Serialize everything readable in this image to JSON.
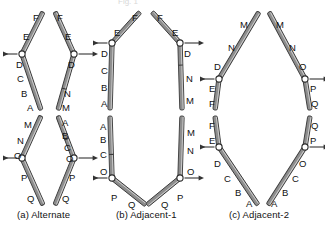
{
  "figure": {
    "top_fragment": "Fig. 1",
    "background": "#ffffff",
    "rod_fill": "#8d8d8d",
    "rod_stroke": "#3a3a3a",
    "joint_fill": "#ffffff",
    "joint_stroke": "#2b2b2b",
    "arrow_color": "#333333",
    "text_color": "#111111"
  },
  "captions": [
    {
      "id": "a",
      "text": "(a) Alternate",
      "x": 17,
      "y": 209
    },
    {
      "id": "b",
      "text": "(b) Adjacent-1",
      "x": 116,
      "y": 209
    },
    {
      "id": "c",
      "text": "(c) Adjacent-2",
      "x": 229,
      "y": 209
    }
  ],
  "panels": [
    {
      "id": "a",
      "name": "Alternate",
      "rods": [
        {
          "name": "a-top-left-upper",
          "x1": 43,
          "y1": 12,
          "x2": 22,
          "y1b": 0,
          "x2b": 0,
          "y2": 54,
          "tick": null
        },
        {
          "name": "a-top-left-lower",
          "x1": 22,
          "y1": 54,
          "x2": 41,
          "y2": 110,
          "tick": null
        },
        {
          "name": "a-top-right-upper",
          "x1": 55,
          "y1": 12,
          "x2": 74,
          "y2": 54,
          "tick": null
        },
        {
          "name": "a-top-right-lower",
          "x1": 74,
          "y1": 54,
          "x2": 58,
          "y2": 110,
          "tick": 0.62
        },
        {
          "name": "a-bot-left-upper",
          "x1": 41,
          "y1": 116,
          "x2": 22,
          "y2": 158,
          "tick": null
        },
        {
          "name": "a-bot-left-lower",
          "x1": 22,
          "y1": 158,
          "x2": 43,
          "y2": 205,
          "tick": null
        },
        {
          "name": "a-bot-right-upper",
          "x1": 58,
          "y1": 116,
          "x2": 74,
          "y2": 158,
          "tick": 0.55
        },
        {
          "name": "a-bot-right-lower",
          "x1": 74,
          "y1": 158,
          "x2": 55,
          "y2": 205,
          "tick": null
        }
      ],
      "joints": [
        {
          "name": "a-joint-upper-left",
          "x": 22,
          "y": 54,
          "arrow": "left"
        },
        {
          "name": "a-joint-upper-right",
          "x": 74,
          "y": 54,
          "arrow": "right"
        },
        {
          "name": "a-joint-lower-left",
          "x": 22,
          "y": 158,
          "arrow": "left"
        },
        {
          "name": "a-joint-lower-right",
          "x": 74,
          "y": 158,
          "arrow": "right"
        }
      ],
      "labels": [
        {
          "t": "F",
          "x": 33,
          "y": 13
        },
        {
          "t": "E",
          "x": 23,
          "y": 32
        },
        {
          "t": "D",
          "x": 16,
          "y": 60
        },
        {
          "t": "C",
          "x": 17,
          "y": 74
        },
        {
          "t": "B",
          "x": 21,
          "y": 89
        },
        {
          "t": "A",
          "x": 27,
          "y": 103
        },
        {
          "t": "F",
          "x": 57,
          "y": 13
        },
        {
          "t": "E",
          "x": 65,
          "y": 32
        },
        {
          "t": "D",
          "x": 68,
          "y": 60
        },
        {
          "t": "N",
          "x": 64,
          "y": 89
        },
        {
          "t": "M",
          "x": 62,
          "y": 103
        },
        {
          "t": "M",
          "x": 24,
          "y": 120
        },
        {
          "t": "N",
          "x": 17,
          "y": 136
        },
        {
          "t": "O",
          "x": 14,
          "y": 151
        },
        {
          "t": "P",
          "x": 21,
          "y": 173
        },
        {
          "t": "Q",
          "x": 27,
          "y": 194
        },
        {
          "t": "A",
          "x": 62,
          "y": 118
        },
        {
          "t": "B",
          "x": 62,
          "y": 131
        },
        {
          "t": "C",
          "x": 64,
          "y": 143
        },
        {
          "t": "O",
          "x": 66,
          "y": 154
        },
        {
          "t": "P",
          "x": 69,
          "y": 173
        },
        {
          "t": "Q",
          "x": 62,
          "y": 194
        }
      ]
    },
    {
      "id": "b",
      "name": "Adjacent-1",
      "rods": [
        {
          "name": "b-top-left-upper",
          "x1": 140,
          "y1": 12,
          "x2": 112,
          "y2": 43,
          "tick": null
        },
        {
          "name": "b-top-left-lower",
          "x1": 112,
          "y1": 43,
          "x2": 110,
          "y2": 110,
          "tick": null
        },
        {
          "name": "b-top-right-upper",
          "x1": 152,
          "y1": 12,
          "x2": 180,
          "y2": 43,
          "tick": null
        },
        {
          "name": "b-top-right-lower",
          "x1": 180,
          "y1": 43,
          "x2": 182,
          "y2": 110,
          "tick": 0.33
        },
        {
          "name": "b-bot-left-upper",
          "x1": 110,
          "y1": 116,
          "x2": 112,
          "y2": 178,
          "tick": 0.62
        },
        {
          "name": "b-bot-left-lower",
          "x1": 112,
          "y1": 178,
          "x2": 146,
          "y2": 205,
          "tick": null
        },
        {
          "name": "b-bot-right-upper",
          "x1": 182,
          "y1": 116,
          "x2": 180,
          "y2": 178,
          "tick": null
        },
        {
          "name": "b-bot-right-lower",
          "x1": 180,
          "y1": 178,
          "x2": 147,
          "y2": 205,
          "tick": null
        }
      ],
      "joints": [
        {
          "name": "b-joint-upper-left",
          "x": 112,
          "y": 43,
          "arrow": "left"
        },
        {
          "name": "b-joint-upper-right",
          "x": 180,
          "y": 43,
          "arrow": "right"
        },
        {
          "name": "b-joint-lower-left",
          "x": 112,
          "y": 178,
          "arrow": "left"
        },
        {
          "name": "b-joint-lower-right",
          "x": 180,
          "y": 178,
          "arrow": "right"
        }
      ],
      "labels": [
        {
          "t": "F",
          "x": 132,
          "y": 13
        },
        {
          "t": "E",
          "x": 114,
          "y": 28
        },
        {
          "t": "D",
          "x": 101,
          "y": 49
        },
        {
          "t": "C",
          "x": 101,
          "y": 66
        },
        {
          "t": "B",
          "x": 101,
          "y": 83
        },
        {
          "t": "A",
          "x": 101,
          "y": 99
        },
        {
          "t": "F",
          "x": 157,
          "y": 13
        },
        {
          "t": "E",
          "x": 172,
          "y": 28
        },
        {
          "t": "D",
          "x": 184,
          "y": 49
        },
        {
          "t": "N",
          "x": 186,
          "y": 74
        },
        {
          "t": "M",
          "x": 186,
          "y": 96
        },
        {
          "t": "A",
          "x": 100,
          "y": 122
        },
        {
          "t": "B",
          "x": 100,
          "y": 135
        },
        {
          "t": "C",
          "x": 100,
          "y": 150
        },
        {
          "t": "O",
          "x": 100,
          "y": 167
        },
        {
          "t": "P",
          "x": 111,
          "y": 193
        },
        {
          "t": "Q",
          "x": 128,
          "y": 200
        },
        {
          "t": "M",
          "x": 187,
          "y": 128
        },
        {
          "t": "N",
          "x": 187,
          "y": 146
        },
        {
          "t": "O",
          "x": 187,
          "y": 167
        },
        {
          "t": "P",
          "x": 177,
          "y": 193
        },
        {
          "t": "Q",
          "x": 161,
          "y": 200
        }
      ]
    },
    {
      "id": "c",
      "name": "Adjacent-2",
      "rods": [
        {
          "name": "c-top-left-upper",
          "x1": 259,
          "y1": 12,
          "x2": 219,
          "y2": 79,
          "tick": null
        },
        {
          "name": "c-top-left-lower",
          "x1": 219,
          "y1": 79,
          "x2": 215,
          "y2": 110,
          "tick": null
        },
        {
          "name": "c-top-right-upper",
          "x1": 269,
          "y1": 12,
          "x2": 305,
          "y2": 79,
          "tick": null
        },
        {
          "name": "c-top-right-lower",
          "x1": 305,
          "y1": 79,
          "x2": 310,
          "y2": 110,
          "tick": null
        },
        {
          "name": "c-bot-left-upper",
          "x1": 215,
          "y1": 116,
          "x2": 219,
          "y2": 147,
          "tick": null
        },
        {
          "name": "c-bot-left-lower",
          "x1": 219,
          "y1": 147,
          "x2": 258,
          "y2": 205,
          "tick": null
        },
        {
          "name": "c-bot-right-upper",
          "x1": 310,
          "y1": 116,
          "x2": 305,
          "y2": 147,
          "tick": null
        },
        {
          "name": "c-bot-right-lower",
          "x1": 305,
          "y1": 147,
          "x2": 268,
          "y2": 205,
          "tick": null
        }
      ],
      "joints": [
        {
          "name": "c-joint-upper-left",
          "x": 219,
          "y": 79,
          "arrow": "left"
        },
        {
          "name": "c-joint-upper-right",
          "x": 305,
          "y": 79,
          "arrow": "right"
        },
        {
          "name": "c-joint-lower-left",
          "x": 219,
          "y": 147,
          "arrow": "left"
        },
        {
          "name": "c-joint-lower-right",
          "x": 305,
          "y": 147,
          "arrow": "right"
        }
      ],
      "labels": [
        {
          "t": "M",
          "x": 240,
          "y": 20
        },
        {
          "t": "N",
          "x": 228,
          "y": 43
        },
        {
          "t": "D",
          "x": 214,
          "y": 62
        },
        {
          "t": "E",
          "x": 209,
          "y": 84
        },
        {
          "t": "F",
          "x": 209,
          "y": 99
        },
        {
          "t": "M",
          "x": 276,
          "y": 20
        },
        {
          "t": "N",
          "x": 289,
          "y": 43
        },
        {
          "t": "O",
          "x": 299,
          "y": 62
        },
        {
          "t": "P",
          "x": 310,
          "y": 84
        },
        {
          "t": "Q",
          "x": 311,
          "y": 99
        },
        {
          "t": "F",
          "x": 209,
          "y": 121
        },
        {
          "t": "E",
          "x": 209,
          "y": 136
        },
        {
          "t": "D",
          "x": 214,
          "y": 159
        },
        {
          "t": "C",
          "x": 224,
          "y": 174
        },
        {
          "t": "B",
          "x": 235,
          "y": 188
        },
        {
          "t": "A",
          "x": 246,
          "y": 199
        },
        {
          "t": "Q",
          "x": 311,
          "y": 121
        },
        {
          "t": "P",
          "x": 310,
          "y": 136
        },
        {
          "t": "O",
          "x": 299,
          "y": 159
        },
        {
          "t": "C",
          "x": 292,
          "y": 174
        },
        {
          "t": "B",
          "x": 282,
          "y": 188
        },
        {
          "t": "A",
          "x": 271,
          "y": 199
        }
      ]
    }
  ]
}
